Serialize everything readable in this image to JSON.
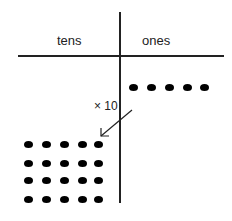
{
  "diagram": {
    "headers": {
      "tens": "tens",
      "ones": "ones"
    },
    "multiplier_label": "× 10",
    "ones_dots": 5,
    "tens_dots_rows": 4,
    "tens_dots_cols": 5,
    "arrow": "ones-to-tens"
  }
}
